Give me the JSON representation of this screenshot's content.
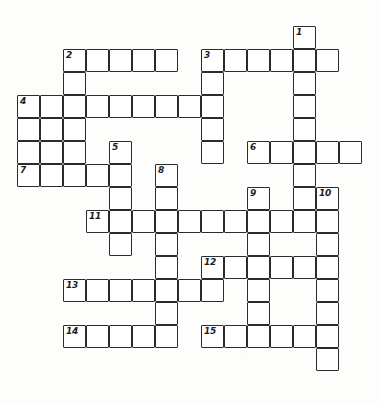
{
  "puzzle": {
    "kind": "crossword-grid",
    "title": "",
    "ink_color": "#2b2b2b",
    "cell_fill": "#ffffff",
    "page_background": "#fdfdfc",
    "cell_size": 23,
    "origin_x": 17,
    "origin_y": 26,
    "columns": 16,
    "rows": 16,
    "numbered_clues": [
      {
        "number": "1",
        "col": 12,
        "row": 0,
        "direction": "down"
      },
      {
        "number": "2",
        "col": 2,
        "row": 1,
        "direction": "across"
      },
      {
        "number": "3",
        "col": 8,
        "row": 1,
        "direction": "across"
      },
      {
        "number": "4",
        "col": 0,
        "row": 3,
        "direction": "across"
      },
      {
        "number": "5",
        "col": 4,
        "row": 5,
        "direction": "down"
      },
      {
        "number": "6",
        "col": 10,
        "row": 5,
        "direction": "across"
      },
      {
        "number": "7",
        "col": 0,
        "row": 6,
        "direction": "across"
      },
      {
        "number": "8",
        "col": 6,
        "row": 6,
        "direction": "down"
      },
      {
        "number": "9",
        "col": 10,
        "row": 7,
        "direction": "down"
      },
      {
        "number": "10",
        "col": 13,
        "row": 7,
        "direction": "down"
      },
      {
        "number": "11",
        "col": 3,
        "row": 8,
        "direction": "across"
      },
      {
        "number": "12",
        "col": 8,
        "row": 10,
        "direction": "across"
      },
      {
        "number": "13",
        "col": 2,
        "row": 11,
        "direction": "across"
      },
      {
        "number": "14",
        "col": 2,
        "row": 13,
        "direction": "across"
      },
      {
        "number": "15",
        "col": 8,
        "row": 13,
        "direction": "across"
      }
    ],
    "entries": [
      {
        "number": "2",
        "direction": "across",
        "col": 2,
        "row": 1,
        "length": 5
      },
      {
        "number": "3",
        "direction": "across",
        "col": 8,
        "row": 1,
        "length": 5
      },
      {
        "number": "1",
        "direction": "down",
        "col": 12,
        "row": 0,
        "length": 8
      },
      {
        "number": "2",
        "direction": "down",
        "col": 2,
        "row": 1,
        "length": 6
      },
      {
        "number": "4",
        "direction": "across",
        "col": 0,
        "row": 3,
        "length": 8
      },
      {
        "number": "3",
        "direction": "down",
        "col": 8,
        "row": 1,
        "length": 5
      },
      {
        "number": "4",
        "direction": "down",
        "col": 0,
        "row": 3,
        "length": 4
      },
      {
        "number": "5",
        "direction": "down",
        "col": 4,
        "row": 5,
        "length": 5
      },
      {
        "number": "6",
        "direction": "across",
        "col": 10,
        "row": 5,
        "length": 5
      },
      {
        "number": "7",
        "direction": "across",
        "col": 0,
        "row": 6,
        "length": 5
      },
      {
        "number": "8",
        "direction": "down",
        "col": 6,
        "row": 6,
        "length": 5
      },
      {
        "number": "9",
        "direction": "down",
        "col": 10,
        "row": 7,
        "length": 7
      },
      {
        "number": "10",
        "direction": "down",
        "col": 13,
        "row": 7,
        "length": 9
      },
      {
        "number": "11",
        "direction": "across",
        "col": 3,
        "row": 8,
        "length": 11
      },
      {
        "number": "12",
        "direction": "across",
        "col": 8,
        "row": 10,
        "length": 6
      },
      {
        "number": "13",
        "direction": "across",
        "col": 2,
        "row": 11,
        "length": 7
      },
      {
        "number": "14",
        "direction": "across",
        "col": 2,
        "row": 13,
        "length": 6
      },
      {
        "number": "15",
        "direction": "across",
        "col": 8,
        "row": 13,
        "length": 6
      }
    ],
    "cells": [
      {
        "col": 12,
        "row": 0
      },
      {
        "col": 2,
        "row": 1
      },
      {
        "col": 3,
        "row": 1
      },
      {
        "col": 4,
        "row": 1
      },
      {
        "col": 5,
        "row": 1
      },
      {
        "col": 6,
        "row": 1
      },
      {
        "col": 8,
        "row": 1
      },
      {
        "col": 9,
        "row": 1
      },
      {
        "col": 10,
        "row": 1
      },
      {
        "col": 11,
        "row": 1
      },
      {
        "col": 12,
        "row": 1
      },
      {
        "col": 13,
        "row": 1
      },
      {
        "col": 2,
        "row": 2
      },
      {
        "col": 8,
        "row": 2
      },
      {
        "col": 12,
        "row": 2
      },
      {
        "col": 0,
        "row": 3
      },
      {
        "col": 1,
        "row": 3
      },
      {
        "col": 2,
        "row": 3
      },
      {
        "col": 3,
        "row": 3
      },
      {
        "col": 4,
        "row": 3
      },
      {
        "col": 5,
        "row": 3
      },
      {
        "col": 6,
        "row": 3
      },
      {
        "col": 7,
        "row": 3
      },
      {
        "col": 8,
        "row": 3
      },
      {
        "col": 12,
        "row": 3
      },
      {
        "col": 0,
        "row": 4
      },
      {
        "col": 1,
        "row": 4
      },
      {
        "col": 2,
        "row": 4
      },
      {
        "col": 8,
        "row": 4
      },
      {
        "col": 12,
        "row": 4
      },
      {
        "col": 0,
        "row": 5
      },
      {
        "col": 1,
        "row": 5
      },
      {
        "col": 2,
        "row": 5
      },
      {
        "col": 4,
        "row": 5
      },
      {
        "col": 8,
        "row": 5
      },
      {
        "col": 10,
        "row": 5
      },
      {
        "col": 11,
        "row": 5
      },
      {
        "col": 12,
        "row": 5
      },
      {
        "col": 13,
        "row": 5
      },
      {
        "col": 14,
        "row": 5
      },
      {
        "col": 0,
        "row": 6
      },
      {
        "col": 1,
        "row": 6
      },
      {
        "col": 2,
        "row": 6
      },
      {
        "col": 3,
        "row": 6
      },
      {
        "col": 4,
        "row": 6
      },
      {
        "col": 6,
        "row": 6
      },
      {
        "col": 12,
        "row": 6
      },
      {
        "col": 4,
        "row": 7
      },
      {
        "col": 6,
        "row": 7
      },
      {
        "col": 10,
        "row": 7
      },
      {
        "col": 12,
        "row": 7
      },
      {
        "col": 13,
        "row": 7
      },
      {
        "col": 3,
        "row": 8
      },
      {
        "col": 4,
        "row": 8
      },
      {
        "col": 5,
        "row": 8
      },
      {
        "col": 6,
        "row": 8
      },
      {
        "col": 7,
        "row": 8
      },
      {
        "col": 8,
        "row": 8
      },
      {
        "col": 9,
        "row": 8
      },
      {
        "col": 10,
        "row": 8
      },
      {
        "col": 11,
        "row": 8
      },
      {
        "col": 12,
        "row": 8
      },
      {
        "col": 13,
        "row": 8
      },
      {
        "col": 4,
        "row": 9
      },
      {
        "col": 6,
        "row": 9
      },
      {
        "col": 10,
        "row": 9
      },
      {
        "col": 13,
        "row": 9
      },
      {
        "col": 6,
        "row": 10
      },
      {
        "col": 8,
        "row": 10
      },
      {
        "col": 9,
        "row": 10
      },
      {
        "col": 10,
        "row": 10
      },
      {
        "col": 11,
        "row": 10
      },
      {
        "col": 12,
        "row": 10
      },
      {
        "col": 13,
        "row": 10
      },
      {
        "col": 2,
        "row": 11
      },
      {
        "col": 3,
        "row": 11
      },
      {
        "col": 4,
        "row": 11
      },
      {
        "col": 5,
        "row": 11
      },
      {
        "col": 6,
        "row": 11
      },
      {
        "col": 7,
        "row": 11
      },
      {
        "col": 8,
        "row": 11
      },
      {
        "col": 10,
        "row": 11
      },
      {
        "col": 13,
        "row": 11
      },
      {
        "col": 6,
        "row": 12
      },
      {
        "col": 10,
        "row": 12
      },
      {
        "col": 13,
        "row": 12
      },
      {
        "col": 2,
        "row": 13
      },
      {
        "col": 3,
        "row": 13
      },
      {
        "col": 4,
        "row": 13
      },
      {
        "col": 5,
        "row": 13
      },
      {
        "col": 6,
        "row": 13
      },
      {
        "col": 8,
        "row": 13
      },
      {
        "col": 9,
        "row": 13
      },
      {
        "col": 10,
        "row": 13
      },
      {
        "col": 11,
        "row": 13
      },
      {
        "col": 12,
        "row": 13
      },
      {
        "col": 13,
        "row": 13
      },
      {
        "col": 13,
        "row": 14
      }
    ]
  }
}
